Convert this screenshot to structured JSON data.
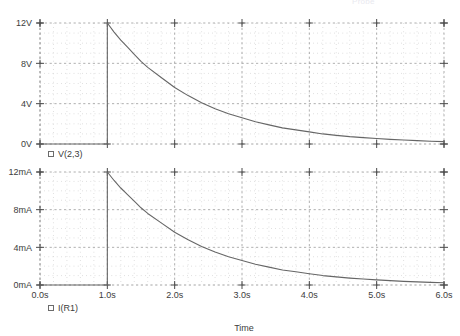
{
  "window": {
    "faint_header": "Probe",
    "app": "spice-transient-probe"
  },
  "chart_data": [
    {
      "id": "voltage-panel",
      "type": "line",
      "title": "",
      "xlabel": "",
      "ylabel": "",
      "xlim": [
        0.0,
        6.0
      ],
      "ylim": [
        0,
        12
      ],
      "grid": true,
      "legend_position": "below-left",
      "series": [
        {
          "name": "V(2,3)",
          "marker": "open-square",
          "color": "#666666",
          "x": [
            0.0,
            0.2,
            0.4,
            0.6,
            0.8,
            1.0,
            1.0,
            1.1,
            1.2,
            1.3,
            1.4,
            1.5,
            1.6,
            1.8,
            2.0,
            2.2,
            2.4,
            2.6,
            2.8,
            3.0,
            3.2,
            3.4,
            3.6,
            3.8,
            4.0,
            4.2,
            4.4,
            4.6,
            4.8,
            5.0,
            5.2,
            5.4,
            5.6,
            5.8,
            6.0
          ],
          "y": [
            0,
            0,
            0,
            0,
            0,
            0,
            12.0,
            11.1,
            10.3,
            9.6,
            8.9,
            8.2,
            7.6,
            6.6,
            5.6,
            4.8,
            4.1,
            3.5,
            3.0,
            2.6,
            2.2,
            1.9,
            1.6,
            1.4,
            1.2,
            1.0,
            0.86,
            0.73,
            0.63,
            0.54,
            0.46,
            0.39,
            0.33,
            0.28,
            0.24
          ]
        }
      ],
      "xticks": [
        {
          "value": 0.0,
          "label": "0.0s"
        },
        {
          "value": 1.0,
          "label": "1.0s"
        },
        {
          "value": 2.0,
          "label": "2.0s"
        },
        {
          "value": 3.0,
          "label": "3.0s"
        },
        {
          "value": 4.0,
          "label": "4.0s"
        },
        {
          "value": 5.0,
          "label": "5.0s"
        },
        {
          "value": 6.0,
          "label": "6.0s"
        }
      ],
      "yticks": [
        {
          "value": 12,
          "label": "12V"
        },
        {
          "value": 8,
          "label": "8V"
        },
        {
          "value": 4,
          "label": "4V"
        },
        {
          "value": 0,
          "label": "0V"
        }
      ]
    },
    {
      "id": "current-panel",
      "type": "line",
      "title": "",
      "xlabel": "Time",
      "ylabel": "",
      "xlim": [
        0.0,
        6.0
      ],
      "ylim": [
        0,
        12
      ],
      "grid": true,
      "legend_position": "below-left",
      "series": [
        {
          "name": "I(R1)",
          "marker": "open-square",
          "color": "#666666",
          "x": [
            0.0,
            0.2,
            0.4,
            0.6,
            0.8,
            1.0,
            1.0,
            1.1,
            1.2,
            1.3,
            1.4,
            1.5,
            1.6,
            1.8,
            2.0,
            2.2,
            2.4,
            2.6,
            2.8,
            3.0,
            3.2,
            3.4,
            3.6,
            3.8,
            4.0,
            4.2,
            4.4,
            4.6,
            4.8,
            5.0,
            5.2,
            5.4,
            5.6,
            5.8,
            6.0
          ],
          "y": [
            0,
            0,
            0,
            0,
            0,
            0,
            12.0,
            11.1,
            10.3,
            9.6,
            8.9,
            8.2,
            7.6,
            6.6,
            5.6,
            4.8,
            4.1,
            3.5,
            3.0,
            2.6,
            2.2,
            1.9,
            1.6,
            1.4,
            1.2,
            1.0,
            0.86,
            0.73,
            0.63,
            0.54,
            0.46,
            0.39,
            0.33,
            0.28,
            0.24
          ]
        }
      ],
      "xticks": [
        {
          "value": 0.0,
          "label": "0.0s"
        },
        {
          "value": 1.0,
          "label": "1.0s"
        },
        {
          "value": 2.0,
          "label": "2.0s"
        },
        {
          "value": 3.0,
          "label": "3.0s"
        },
        {
          "value": 4.0,
          "label": "4.0s"
        },
        {
          "value": 5.0,
          "label": "5.0s"
        },
        {
          "value": 6.0,
          "label": "6.0s"
        }
      ],
      "yticks": [
        {
          "value": 12,
          "label": "12mA"
        },
        {
          "value": 8,
          "label": "8mA"
        },
        {
          "value": 4,
          "label": "4mA"
        },
        {
          "value": 0,
          "label": "0mA"
        }
      ]
    }
  ],
  "colors": {
    "trace": "#666666",
    "axis": "#4a4a4a",
    "grid_major": "#9a9a9a",
    "grid_minor": "#c9c9c9",
    "text": "#3c3c3c",
    "background": "#ffffff"
  }
}
